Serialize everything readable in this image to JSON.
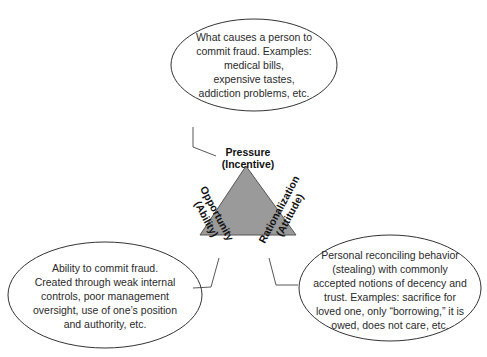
{
  "diagram": {
    "colors": {
      "triangle_fill": "#9a9a9a",
      "triangle_stroke": "#555555",
      "outline": "#333333",
      "background": "#ffffff"
    },
    "vertices": {
      "pressure": {
        "label_line1": "Pressure",
        "label_line2": "(Incentive)"
      },
      "opportunity": {
        "label_line1": "Opportunity",
        "label_line2": "(Ability)"
      },
      "rationalization": {
        "label_line1": "Rationalization",
        "label_line2": "(Attitude)"
      }
    },
    "callouts": {
      "pressure": {
        "lines": [
          "What causes a person to",
          "commit fraud. Examples:",
          "medical bills,",
          "expensive tastes,",
          "addiction problems, etc."
        ]
      },
      "opportunity": {
        "lines": [
          "Ability to commit fraud.",
          "Created through weak internal",
          "controls, poor management",
          "oversight, use of one’s position",
          "and authority, etc."
        ]
      },
      "rationalization": {
        "lines": [
          "Personal reconciling behavior",
          "(stealing) with commonly",
          "accepted notions of decency and",
          "trust. Examples: sacrifice for",
          "loved one, only “borrowing,” it is",
          "owed, does not care, etc."
        ]
      }
    }
  }
}
